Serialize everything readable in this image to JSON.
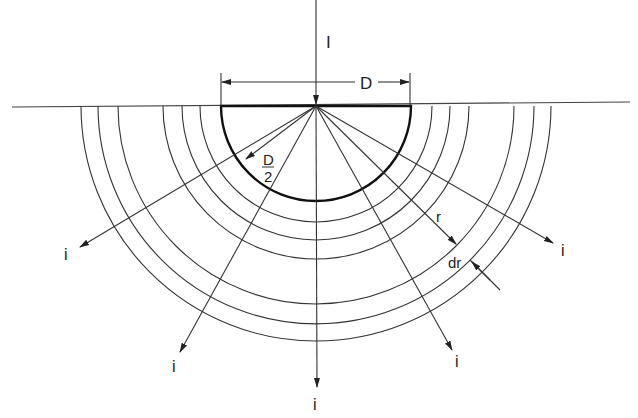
{
  "diagram": {
    "labels": {
      "current_in": "I",
      "diameter": "D",
      "radius_num": "D",
      "radius_den": "2",
      "shell_radius": "r",
      "shell_thickness": "dr",
      "current_out": "i"
    },
    "center": [
      316,
      106
    ],
    "electrode_radius": 95,
    "shell_radii": [
      116,
      134,
      153,
      198,
      218,
      235
    ],
    "ray_angles_deg": [
      -20,
      -40,
      -65,
      -90,
      -115,
      -140,
      -160
    ],
    "colors": {
      "line": "#222222",
      "background": "#ffffff"
    }
  }
}
